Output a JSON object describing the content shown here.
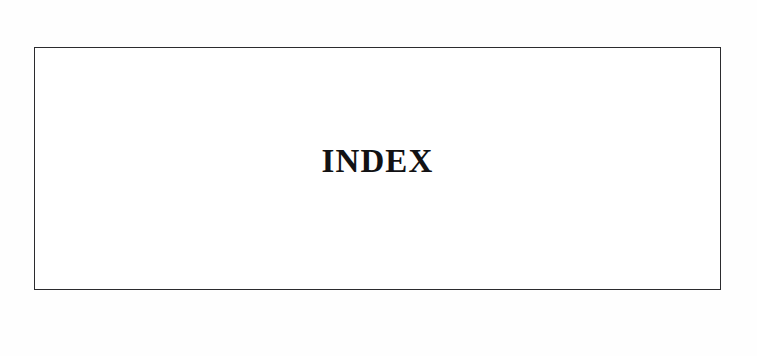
{
  "page": {
    "background_color": "#ffffff",
    "surface_color": "#fefefe"
  },
  "index_section": {
    "frame": {
      "border_color": "#2b2b2e",
      "fill_color": "#ffffff"
    },
    "title": "INDEX",
    "title_color": "#121214"
  }
}
